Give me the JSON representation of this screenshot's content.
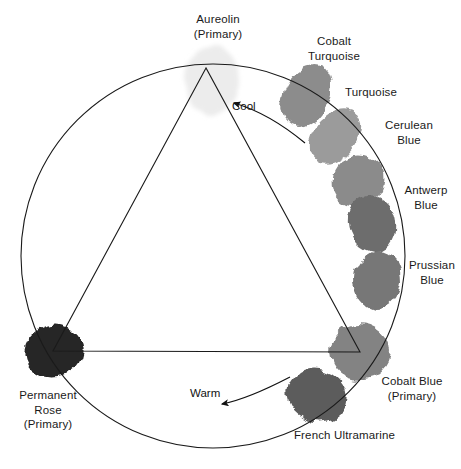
{
  "diagram": {
    "type": "color-wheel-triangle",
    "title": "",
    "geometry": {
      "circle": {
        "cx": 213,
        "cy": 256,
        "r": 192
      },
      "triangle": {
        "apex": [
          206,
          68
        ],
        "left": [
          53,
          351
        ],
        "right": [
          360,
          352
        ]
      },
      "canvas": {
        "width": 461,
        "height": 469
      }
    },
    "swatches": [
      {
        "id": "aureolin",
        "name": "Aureolin",
        "qualifier": "(Primary)",
        "color": "#ececec",
        "cx": 212,
        "cy": 80,
        "rx": 27,
        "ry": 35,
        "rotate": -2,
        "primary": true
      },
      {
        "id": "cobalt-turquoise",
        "name": "Cobalt Turquoise",
        "qualifier": "",
        "color": "#8c8c8c",
        "cx": 307,
        "cy": 96,
        "rx": 22,
        "ry": 33,
        "rotate": 28,
        "primary": false
      },
      {
        "id": "turquoise",
        "name": "Turquoise",
        "qualifier": "",
        "color": "#9b9b9b",
        "cx": 335,
        "cy": 136,
        "rx": 21,
        "ry": 31,
        "rotate": 38,
        "primary": false
      },
      {
        "id": "cerulean-blue",
        "name": "Cerulean Blue",
        "qualifier": "",
        "color": "#8b8b8b",
        "cx": 358,
        "cy": 180,
        "rx": 25,
        "ry": 27,
        "rotate": 58,
        "primary": false
      },
      {
        "id": "antwerp-blue",
        "name": "Antwerp Blue",
        "qualifier": "",
        "color": "#6d6d6d",
        "cx": 372,
        "cy": 224,
        "rx": 29,
        "ry": 24,
        "rotate": 78,
        "primary": false
      },
      {
        "id": "prussian-blue",
        "name": "Prussian Blue",
        "qualifier": "",
        "color": "#777777",
        "cx": 378,
        "cy": 280,
        "rx": 29,
        "ry": 23,
        "rotate": 92,
        "primary": false
      },
      {
        "id": "cobalt-blue",
        "name": "Cobalt Blue",
        "qualifier": "(Primary)",
        "color": "#838383",
        "cx": 360,
        "cy": 352,
        "rx": 30,
        "ry": 28,
        "rotate": 10,
        "primary": true
      },
      {
        "id": "french-ultramarine",
        "name": "French Ultramarine",
        "qualifier": "",
        "color": "#5c5c5c",
        "cx": 317,
        "cy": 395,
        "rx": 30,
        "ry": 26,
        "rotate": 18,
        "primary": false
      },
      {
        "id": "permanent-rose",
        "name": "Permanent Rose",
        "qualifier": "(Primary)",
        "color": "#262626",
        "cx": 53,
        "cy": 351,
        "rx": 30,
        "ry": 26,
        "rotate": -18,
        "primary": true
      }
    ],
    "labels": [
      {
        "id": "aureolin-label",
        "lines": [
          "Aureolin",
          "(Primary)"
        ],
        "x": 183,
        "y": 12,
        "width": 70,
        "align": "center"
      },
      {
        "id": "cobalt-turquoise-label",
        "lines": [
          "Cobalt",
          "Turquoise"
        ],
        "x": 295,
        "y": 34,
        "width": 78,
        "align": "center"
      },
      {
        "id": "turquoise-label",
        "lines": [
          "Turquoise"
        ],
        "x": 345,
        "y": 85,
        "width": 62,
        "align": "left"
      },
      {
        "id": "cerulean-blue-label",
        "lines": [
          "Cerulean",
          "Blue"
        ],
        "x": 378,
        "y": 118,
        "width": 62,
        "align": "center"
      },
      {
        "id": "antwerp-blue-label",
        "lines": [
          "Antwerp",
          "Blue"
        ],
        "x": 397,
        "y": 183,
        "width": 58,
        "align": "center"
      },
      {
        "id": "prussian-blue-label",
        "lines": [
          "Prussian",
          "Blue"
        ],
        "x": 404,
        "y": 258,
        "width": 56,
        "align": "center"
      },
      {
        "id": "cobalt-blue-label",
        "lines": [
          "Cobalt Blue",
          "(Primary)"
        ],
        "x": 372,
        "y": 374,
        "width": 80,
        "align": "center"
      },
      {
        "id": "french-ultramarine-label",
        "lines": [
          "French Ultramarine"
        ],
        "x": 287,
        "y": 428,
        "width": 115,
        "align": "center"
      },
      {
        "id": "permanent-rose-label",
        "lines": [
          "Permanent",
          "Rose",
          "(Primary)"
        ],
        "x": 8,
        "y": 388,
        "width": 80,
        "align": "center"
      }
    ],
    "annotations": [
      {
        "id": "cool-arrow",
        "label": "Cool",
        "x": 232,
        "y": 100,
        "direction": "counter-clockwise"
      },
      {
        "id": "warm-arrow",
        "label": "Warm",
        "x": 190,
        "y": 387,
        "direction": "clockwise"
      }
    ]
  }
}
